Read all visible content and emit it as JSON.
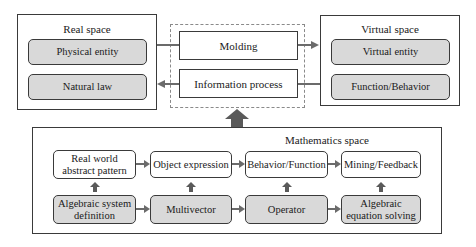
{
  "real_space": {
    "title": "Real space",
    "items": [
      {
        "label": "Physical entity"
      },
      {
        "label": "Natural law"
      }
    ]
  },
  "bridge": {
    "molding": "Molding",
    "information_process": "Information process"
  },
  "virtual_space": {
    "title": "Virtual space",
    "items": [
      {
        "label": "Virtual entity"
      },
      {
        "label": "Function/Behavior"
      }
    ]
  },
  "mathematics_space": {
    "title": "Mathematics space",
    "top_row": [
      {
        "label": "Real world abstract pattern"
      },
      {
        "label": "Object expression"
      },
      {
        "label": "Behavior/Function"
      },
      {
        "label": "Mining/Feedback"
      }
    ],
    "bottom_row": [
      {
        "label": "Algebraic system definition"
      },
      {
        "label": "Multivector"
      },
      {
        "label": "Operator"
      },
      {
        "label": "Algebraic equation solving"
      }
    ]
  },
  "colors": {
    "gray_fill": "#d9d9d9",
    "border": "#3a3a3a",
    "arrow": "#6b6b6b"
  }
}
